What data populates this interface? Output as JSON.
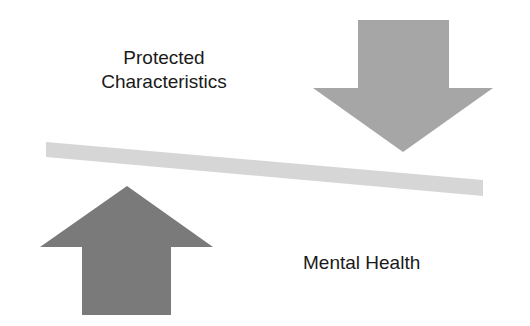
{
  "diagram": {
    "type": "balance",
    "labels": {
      "top_line1": "Protected",
      "top_line2": "Characteristics",
      "bottom": "Mental Health"
    },
    "elements": {
      "down_arrow": {
        "direction": "down",
        "color": "#a6a6a6",
        "meaning": "weighted down"
      },
      "up_arrow": {
        "direction": "up",
        "color": "#7a7a7a",
        "meaning": "lifted up"
      },
      "beam": {
        "color": "#d6d6d6",
        "tilt": "lower on right"
      }
    }
  }
}
